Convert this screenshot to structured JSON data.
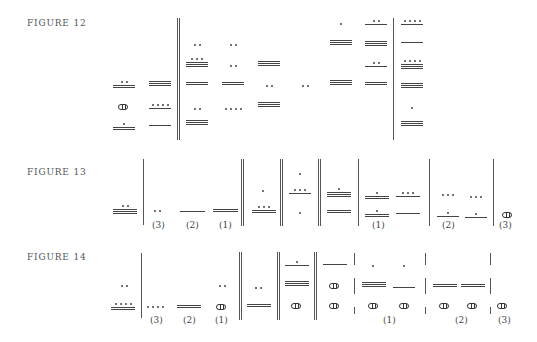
{
  "figures": [
    {
      "label": "FIGURE 12",
      "x": 27,
      "y": 18
    },
    {
      "label": "FIGURE 13",
      "x": 27,
      "y": 167
    },
    {
      "label": "FIGURE 14",
      "x": 27,
      "y": 252
    }
  ],
  "vlines": [
    {
      "x": 177,
      "y1": 18,
      "y2": 140
    },
    {
      "x": 179,
      "y1": 18,
      "y2": 140
    },
    {
      "x": 393,
      "y1": 18,
      "y2": 140
    },
    {
      "x": 143,
      "y1": 159,
      "y2": 225
    },
    {
      "x": 241,
      "y1": 159,
      "y2": 226
    },
    {
      "x": 243,
      "y1": 159,
      "y2": 226
    },
    {
      "x": 280,
      "y1": 159,
      "y2": 226
    },
    {
      "x": 282,
      "y1": 159,
      "y2": 226
    },
    {
      "x": 318,
      "y1": 159,
      "y2": 226
    },
    {
      "x": 320,
      "y1": 159,
      "y2": 226
    },
    {
      "x": 358,
      "y1": 159,
      "y2": 226
    },
    {
      "x": 429,
      "y1": 159,
      "y2": 226
    },
    {
      "x": 493,
      "y1": 159,
      "y2": 226
    },
    {
      "x": 141,
      "y1": 253,
      "y2": 318
    },
    {
      "x": 239,
      "y1": 252,
      "y2": 320
    },
    {
      "x": 241,
      "y1": 252,
      "y2": 320
    },
    {
      "x": 277,
      "y1": 252,
      "y2": 320
    },
    {
      "x": 279,
      "y1": 252,
      "y2": 320
    },
    {
      "x": 314,
      "y1": 252,
      "y2": 320
    },
    {
      "x": 316,
      "y1": 252,
      "y2": 320
    },
    {
      "x": 354,
      "y1": 253,
      "y2": 265
    },
    {
      "x": 354,
      "y1": 278,
      "y2": 294
    },
    {
      "x": 354,
      "y1": 307,
      "y2": 314
    },
    {
      "x": 425,
      "y1": 253,
      "y2": 265
    },
    {
      "x": 425,
      "y1": 278,
      "y2": 294
    },
    {
      "x": 425,
      "y1": 307,
      "y2": 314
    },
    {
      "x": 490,
      "y1": 253,
      "y2": 265
    },
    {
      "x": 490,
      "y1": 278,
      "y2": 294
    },
    {
      "x": 490,
      "y1": 307,
      "y2": 314
    }
  ],
  "glyphs": [
    {
      "x": 113,
      "y": 81,
      "bars": 2,
      "dots": 2,
      "w": 22
    },
    {
      "x": 118,
      "y": 104,
      "shell": true
    },
    {
      "x": 113,
      "y": 123,
      "bars": 2,
      "dots": 1,
      "w": 22
    },
    {
      "x": 149,
      "y": 81,
      "bars": 3,
      "dots": 0,
      "w": 22
    },
    {
      "x": 149,
      "y": 104,
      "bars": 1,
      "dots": 4,
      "w": 22
    },
    {
      "x": 149,
      "y": 125,
      "bars": 1,
      "dots": 0,
      "w": 22
    },
    {
      "x": 186,
      "y": 44,
      "bars": 0,
      "dots": 2,
      "w": 22
    },
    {
      "x": 186,
      "y": 58,
      "bars": 3,
      "dots": 3,
      "w": 22
    },
    {
      "x": 186,
      "y": 82,
      "bars": 2,
      "dots": 0,
      "w": 22
    },
    {
      "x": 186,
      "y": 108,
      "bars": 0,
      "dots": 2,
      "w": 22
    },
    {
      "x": 186,
      "y": 120,
      "bars": 3,
      "dots": 0,
      "w": 22
    },
    {
      "x": 222,
      "y": 44,
      "bars": 0,
      "dots": 2,
      "w": 22
    },
    {
      "x": 222,
      "y": 65,
      "bars": 0,
      "dots": 2,
      "w": 22
    },
    {
      "x": 222,
      "y": 82,
      "bars": 2,
      "dots": 0,
      "w": 22
    },
    {
      "x": 222,
      "y": 108,
      "bars": 0,
      "dots": 4,
      "w": 22
    },
    {
      "x": 258,
      "y": 61,
      "bars": 3,
      "dots": 0,
      "w": 22
    },
    {
      "x": 258,
      "y": 85,
      "bars": 0,
      "dots": 2,
      "w": 22
    },
    {
      "x": 258,
      "y": 102,
      "bars": 3,
      "dots": 0,
      "w": 22
    },
    {
      "x": 294,
      "y": 85,
      "bars": 0,
      "dots": 2,
      "w": 22
    },
    {
      "x": 330,
      "y": 23,
      "bars": 0,
      "dots": 1,
      "w": 22
    },
    {
      "x": 330,
      "y": 40,
      "bars": 3,
      "dots": 0,
      "w": 22
    },
    {
      "x": 330,
      "y": 80,
      "bars": 3,
      "dots": 0,
      "w": 22
    },
    {
      "x": 365,
      "y": 20,
      "bars": 1,
      "dots": 2,
      "w": 22
    },
    {
      "x": 365,
      "y": 41,
      "bars": 3,
      "dots": 0,
      "w": 22
    },
    {
      "x": 365,
      "y": 62,
      "bars": 1,
      "dots": 2,
      "w": 22
    },
    {
      "x": 365,
      "y": 82,
      "bars": 2,
      "dots": 0,
      "w": 22
    },
    {
      "x": 401,
      "y": 20,
      "bars": 1,
      "dots": 4,
      "w": 22
    },
    {
      "x": 401,
      "y": 42,
      "bars": 1,
      "dots": 0,
      "w": 22
    },
    {
      "x": 401,
      "y": 60,
      "bars": 3,
      "dots": 4,
      "w": 22
    },
    {
      "x": 401,
      "y": 83,
      "bars": 3,
      "dots": 0,
      "w": 22
    },
    {
      "x": 401,
      "y": 107,
      "bars": 0,
      "dots": 1,
      "w": 22
    },
    {
      "x": 401,
      "y": 121,
      "bars": 3,
      "dots": 0,
      "w": 22
    },
    {
      "x": 113,
      "y": 205,
      "bars": 3,
      "dots": 2,
      "w": 24
    },
    {
      "x": 150,
      "y": 210,
      "bars": 0,
      "dots": 2,
      "w": 14
    },
    {
      "x": 180,
      "y": 211,
      "bars": 1,
      "dots": 0,
      "w": 25
    },
    {
      "x": 213,
      "y": 209,
      "bars": 2,
      "dots": 0,
      "w": 25
    },
    {
      "x": 252,
      "y": 190,
      "bars": 0,
      "dots": 1,
      "w": 22
    },
    {
      "x": 252,
      "y": 206,
      "bars": 2,
      "dots": 3,
      "w": 24
    },
    {
      "x": 289,
      "y": 173,
      "bars": 0,
      "dots": 1,
      "w": 22
    },
    {
      "x": 289,
      "y": 189,
      "bars": 1,
      "dots": 3,
      "w": 22
    },
    {
      "x": 289,
      "y": 212,
      "bars": 0,
      "dots": 1,
      "w": 22
    },
    {
      "x": 327,
      "y": 188,
      "bars": 3,
      "dots": 1,
      "w": 24
    },
    {
      "x": 327,
      "y": 210,
      "bars": 2,
      "dots": 0,
      "w": 24
    },
    {
      "x": 365,
      "y": 192,
      "bars": 2,
      "dots": 1,
      "w": 24
    },
    {
      "x": 365,
      "y": 210,
      "bars": 2,
      "dots": 1,
      "w": 24
    },
    {
      "x": 396,
      "y": 192,
      "bars": 1,
      "dots": 3,
      "w": 24
    },
    {
      "x": 396,
      "y": 213,
      "bars": 1,
      "dots": 0,
      "w": 24
    },
    {
      "x": 437,
      "y": 194,
      "bars": 0,
      "dots": 3,
      "w": 22
    },
    {
      "x": 437,
      "y": 212,
      "bars": 1,
      "dots": 1,
      "w": 22
    },
    {
      "x": 465,
      "y": 196,
      "bars": 0,
      "dots": 3,
      "w": 22
    },
    {
      "x": 465,
      "y": 213,
      "bars": 1,
      "dots": 1,
      "w": 22
    },
    {
      "x": 502,
      "y": 212,
      "shell": true
    },
    {
      "x": 113,
      "y": 285,
      "bars": 0,
      "dots": 2,
      "w": 22
    },
    {
      "x": 111,
      "y": 303,
      "bars": 2,
      "dots": 4,
      "w": 24
    },
    {
      "x": 147,
      "y": 306,
      "bars": 0,
      "dots": 4,
      "w": 16
    },
    {
      "x": 177,
      "y": 305,
      "bars": 2,
      "dots": 0,
      "w": 24
    },
    {
      "x": 215,
      "y": 285,
      "bars": 0,
      "dots": 2,
      "w": 14
    },
    {
      "x": 216,
      "y": 304,
      "shell": true
    },
    {
      "x": 247,
      "y": 287,
      "bars": 0,
      "dots": 2,
      "w": 22
    },
    {
      "x": 247,
      "y": 304,
      "bars": 2,
      "dots": 0,
      "w": 24
    },
    {
      "x": 285,
      "y": 261,
      "bars": 1,
      "dots": 1,
      "w": 24
    },
    {
      "x": 285,
      "y": 281,
      "bars": 3,
      "dots": 0,
      "w": 24
    },
    {
      "x": 291,
      "y": 303,
      "shell": true
    },
    {
      "x": 323,
      "y": 264,
      "bars": 1,
      "dots": 0,
      "w": 24
    },
    {
      "x": 329,
      "y": 283,
      "shell": true
    },
    {
      "x": 329,
      "y": 303,
      "shell": true
    },
    {
      "x": 362,
      "y": 265,
      "bars": 0,
      "dots": 1,
      "w": 22
    },
    {
      "x": 362,
      "y": 282,
      "bars": 3,
      "dots": 0,
      "w": 24
    },
    {
      "x": 368,
      "y": 303,
      "shell": true
    },
    {
      "x": 393,
      "y": 265,
      "bars": 0,
      "dots": 1,
      "w": 22
    },
    {
      "x": 393,
      "y": 287,
      "bars": 1,
      "dots": 0,
      "w": 22
    },
    {
      "x": 399,
      "y": 303,
      "shell": true
    },
    {
      "x": 433,
      "y": 284,
      "bars": 2,
      "dots": 0,
      "w": 24
    },
    {
      "x": 439,
      "y": 303,
      "shell": true
    },
    {
      "x": 461,
      "y": 284,
      "bars": 2,
      "dots": 0,
      "w": 24
    },
    {
      "x": 467,
      "y": 303,
      "shell": true
    },
    {
      "x": 497,
      "y": 303,
      "shell": true
    }
  ],
  "parens": [
    {
      "text": "(3)",
      "x": 152,
      "y": 220
    },
    {
      "text": "(2)",
      "x": 186,
      "y": 220
    },
    {
      "text": "(1)",
      "x": 219,
      "y": 220
    },
    {
      "text": "(1)",
      "x": 372,
      "y": 220
    },
    {
      "text": "(2)",
      "x": 442,
      "y": 220
    },
    {
      "text": "(3)",
      "x": 499,
      "y": 220
    },
    {
      "text": "(3)",
      "x": 150,
      "y": 315
    },
    {
      "text": "(2)",
      "x": 183,
      "y": 315
    },
    {
      "text": "(1)",
      "x": 215,
      "y": 315
    },
    {
      "text": "(1)",
      "x": 383,
      "y": 315
    },
    {
      "text": "(2)",
      "x": 455,
      "y": 315
    },
    {
      "text": "(3)",
      "x": 498,
      "y": 315
    }
  ]
}
